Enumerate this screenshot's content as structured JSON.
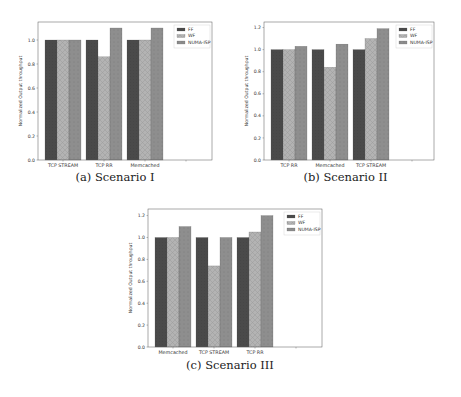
{
  "colors": {
    "FF": "#4a4a4a",
    "WF": "#b3b3b3",
    "NUMA-ISP": "#8e8e8e",
    "axis": "#555555",
    "text": "#222222"
  },
  "chart_data": [
    {
      "type": "bar",
      "title": "",
      "caption": "(a) Scenario I",
      "xlabel": "",
      "ylabel": "Normalized Output throughput",
      "ylim": [
        0,
        1.15
      ],
      "yticks": [
        "0.0",
        "0.2",
        "0.4",
        "0.6",
        "0.8",
        "1.0"
      ],
      "ytick_values": [
        0,
        0.2,
        0.4,
        0.6,
        0.8,
        1.0
      ],
      "categories": [
        "TCP STREAM",
        "TCP RR",
        "Memcached"
      ],
      "series": [
        {
          "name": "FF",
          "values": [
            1.0,
            1.0,
            1.0
          ]
        },
        {
          "name": "WF",
          "values": [
            1.0,
            0.86,
            1.0
          ]
        },
        {
          "name": "NUMA-ISP",
          "values": [
            1.0,
            1.1,
            1.1
          ]
        }
      ],
      "legend": {
        "position": "top-right",
        "entries": [
          "FF",
          "WF",
          "NUMA-ISP"
        ]
      },
      "grid": false
    },
    {
      "type": "bar",
      "title": "",
      "caption": "(b) Scenario II",
      "xlabel": "",
      "ylabel": "Normalized Output throughput",
      "ylim": [
        0,
        1.25
      ],
      "yticks": [
        "0.0",
        "0.2",
        "0.4",
        "0.6",
        "0.8",
        "1.0",
        "1.2"
      ],
      "ytick_values": [
        0,
        0.2,
        0.4,
        0.6,
        0.8,
        1.0,
        1.2
      ],
      "categories": [
        "TCP RR",
        "Memcached",
        "TCP STREAM"
      ],
      "series": [
        {
          "name": "FF",
          "values": [
            1.0,
            1.0,
            1.0
          ]
        },
        {
          "name": "WF",
          "values": [
            1.0,
            0.84,
            1.1
          ]
        },
        {
          "name": "NUMA-ISP",
          "values": [
            1.03,
            1.05,
            1.19
          ]
        }
      ],
      "legend": {
        "position": "top-right",
        "entries": [
          "FF",
          "WF",
          "NUMA-ISP"
        ]
      },
      "grid": false
    },
    {
      "type": "bar",
      "title": "",
      "caption": "(c) Scenario III",
      "xlabel": "",
      "ylabel": "Normalized Output throughput",
      "ylim": [
        0,
        1.26
      ],
      "yticks": [
        "0.0",
        "0.2",
        "0.4",
        "0.6",
        "0.8",
        "1.0",
        "1.2"
      ],
      "ytick_values": [
        0,
        0.2,
        0.4,
        0.6,
        0.8,
        1.0,
        1.2
      ],
      "categories": [
        "Memcached",
        "TCP STREAM",
        "TCP RR"
      ],
      "series": [
        {
          "name": "FF",
          "values": [
            1.0,
            1.0,
            1.0
          ]
        },
        {
          "name": "WF",
          "values": [
            1.0,
            0.74,
            1.05
          ]
        },
        {
          "name": "NUMA-ISP",
          "values": [
            1.1,
            1.0,
            1.2
          ]
        }
      ],
      "legend": {
        "position": "top-right",
        "entries": [
          "FF",
          "WF",
          "NUMA-ISP"
        ]
      },
      "grid": false
    }
  ]
}
